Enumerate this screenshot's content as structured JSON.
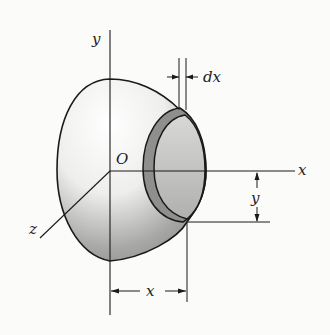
{
  "figure": {
    "labels": {
      "y_axis": "y",
      "x_axis": "x",
      "z_axis": "z",
      "origin": "O",
      "thickness": "dx",
      "radius_dim": "y",
      "distance_dim": "x"
    },
    "colors": {
      "line": "#1a1a1a",
      "background": "#fbfbfa",
      "shell_light": "#f4f4f2",
      "shell_dark": "#9a9a98",
      "disk_ring": "#8c8c8a",
      "disk_face": "#c4c4c2"
    }
  }
}
